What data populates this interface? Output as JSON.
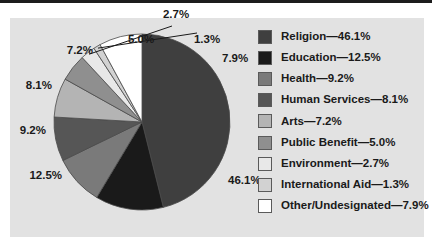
{
  "figure": {
    "background_color": "#e2e2e2",
    "page_background": "#ffffff",
    "rule_color": "#1c1c1c"
  },
  "chart_data": {
    "type": "pie",
    "title": "",
    "xlabel": "",
    "ylabel": "",
    "legend_position": "right",
    "grid": false,
    "start_angle_deg": 0,
    "direction": "clockwise",
    "categories": [
      "Religion",
      "Education",
      "Health",
      "Human Services",
      "Arts",
      "Public Benefit",
      "Environment",
      "International Aid",
      "Other/Undesignated"
    ],
    "values": [
      46.1,
      12.5,
      9.2,
      8.1,
      7.2,
      5.0,
      2.7,
      1.3,
      7.9
    ],
    "value_labels": [
      "46.1%",
      "12.5%",
      "9.2%",
      "8.1%",
      "7.2%",
      "5.0%",
      "2.7%",
      "1.3%",
      "7.9%"
    ],
    "colors": [
      "#3f3f3f",
      "#1a1a1a",
      "#7a7a7a",
      "#565656",
      "#b4b4b4",
      "#8f8f8f",
      "#e8e8e8",
      "#d2d2d2",
      "#ffffff"
    ],
    "legend_entries": [
      "Religion—46.1%",
      "Education—12.5%",
      "Health—9.2%",
      "Human Services—8.1%",
      "Arts—7.2%",
      "Public Benefit—5.0%",
      "Environment—2.7%",
      "International Aid—1.3%",
      "Other/Undesignated—7.9%"
    ],
    "leader_line_categories": [
      "Environment",
      "International Aid"
    ]
  },
  "labels": {
    "religion": "46.1%",
    "education": "12.5%",
    "health": "9.2%",
    "human_services": "8.1%",
    "arts": "7.2%",
    "public_benefit": "5.0%",
    "environment": "2.7%",
    "international_aid": "1.3%",
    "other": "7.9%"
  },
  "legend": {
    "items": [
      {
        "label": "Religion—46.1%",
        "color": "#3f3f3f"
      },
      {
        "label": "Education—12.5%",
        "color": "#1a1a1a"
      },
      {
        "label": "Health—9.2%",
        "color": "#7a7a7a"
      },
      {
        "label": "Human Services—8.1%",
        "color": "#565656"
      },
      {
        "label": "Arts—7.2%",
        "color": "#b4b4b4"
      },
      {
        "label": "Public Benefit—5.0%",
        "color": "#8f8f8f"
      },
      {
        "label": "Environment—2.7%",
        "color": "#e8e8e8"
      },
      {
        "label": "International Aid—1.3%",
        "color": "#d2d2d2"
      },
      {
        "label": "Other/Undesignated—7.9%",
        "color": "#ffffff"
      }
    ]
  }
}
